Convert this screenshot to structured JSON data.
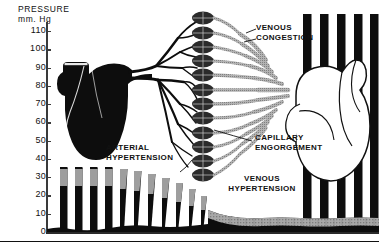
{
  "figure": {
    "axis_title": "PRESSURE\nmm. Hg",
    "y_unit": "mm. Hg",
    "y_label": "PRESSURE"
  },
  "annotations": {
    "venous_congestion": "VENOUS\nCONGESTION",
    "arterial_hypertension": "ARTERIAL\nHYPERTENSION",
    "capillary_engorgement": "CAPILLARY\nENGORGEMENT",
    "venous_hypertension": "VENOUS\nHYPERTENSION"
  },
  "colors": {
    "artery": "#0d0d0d",
    "vein": "#9a9a9a",
    "capillary": "#2e2e2e",
    "axis": "#3a3a3a",
    "background": "#ffffff"
  },
  "chart_data": {
    "type": "area",
    "title": "PRESSURE mm. Hg",
    "xlabel": "",
    "ylabel": "PRESSURE mm. Hg",
    "ylim": [
      0,
      115
    ],
    "grid": false,
    "legend_position": "none",
    "yticks": [
      0,
      10,
      20,
      30,
      40,
      50,
      60,
      70,
      80,
      90,
      100,
      110
    ],
    "ytick_labels": [
      "0",
      "10",
      "20",
      "30",
      "40",
      "50",
      "60",
      "70",
      "80",
      "90",
      "100",
      "110"
    ],
    "series": [
      {
        "name": "Systolic pressure (pulse peak)",
        "values": [
          36,
          36,
          36,
          36,
          36,
          35,
          34,
          33,
          31,
          29,
          26,
          22,
          17,
          13,
          11,
          10,
          9,
          9,
          8,
          8
        ]
      },
      {
        "name": "Diastolic pressure (pulse trough)",
        "values": [
          26,
          26,
          26,
          26,
          26,
          24,
          22,
          20,
          18,
          16,
          13,
          10,
          8,
          7,
          6,
          6,
          6,
          5,
          5,
          5
        ]
      }
    ],
    "annotations": [
      {
        "text": "ARTERIAL HYPERTENSION",
        "region": "arterial"
      },
      {
        "text": "CAPILLARY ENGORGEMENT",
        "region": "capillary"
      },
      {
        "text": "VENOUS CONGESTION",
        "region": "venous"
      },
      {
        "text": "VENOUS HYPERTENSION",
        "region": "venous-trace"
      }
    ]
  }
}
